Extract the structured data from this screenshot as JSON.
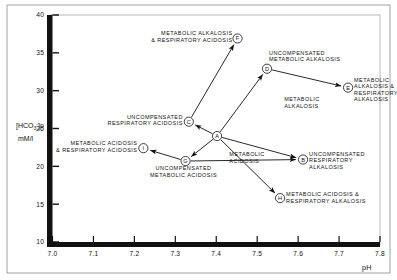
{
  "chart_data": {
    "type": "scatter",
    "title": "",
    "xlabel": "pH",
    "ylabel": "[HCO3-]p mM/l",
    "xlim": [
      7.0,
      7.8
    ],
    "ylim": [
      10,
      40
    ],
    "xticks": [
      "7.0",
      "7.1",
      "7.2",
      "7.3",
      "7.4",
      "7.5",
      "7.6",
      "7.7",
      "7.8"
    ],
    "xtick_values": [
      7.0,
      7.1,
      7.2,
      7.3,
      7.4,
      7.5,
      7.6,
      7.7,
      7.8
    ],
    "yticks": [
      "10",
      "15",
      "20",
      "25",
      "30",
      "35",
      "40"
    ],
    "ytick_values": [
      10,
      15,
      20,
      25,
      30,
      35,
      40
    ],
    "grid": false,
    "legend": "none",
    "points": [
      {
        "id": "A",
        "x": 7.402,
        "y": 24.0,
        "label": "",
        "label_lines": [],
        "label_anchor": "none",
        "label_dx": 0,
        "label_dy": 0
      },
      {
        "id": "B",
        "x": 7.612,
        "y": 20.9,
        "label": "UNCOMPENSATED RESPIRATORY ALKALOSIS",
        "label_lines": [
          "UNCOMPENSATED",
          "RESPIRATORY",
          "ALKALOSIS"
        ],
        "label_anchor": "start",
        "label_dx": 6,
        "label_dy": -4
      },
      {
        "id": "C",
        "x": 7.333,
        "y": 25.9,
        "label": "UNCOMPENSATED RESPIRATORY ACIDOSIS",
        "label_lines": [
          "UNCOMPENSATED",
          "RESPIRATORY  ACIDOSIS"
        ],
        "label_anchor": "end",
        "label_dx": -6,
        "label_dy": -3
      },
      {
        "id": "D",
        "x": 7.524,
        "y": 32.9,
        "label": "UNCOMPENSATED METABOLIC ALKALOSIS",
        "label_lines": [
          "UNCOMPENSATED",
          "METABOLIC  ALKALOSIS"
        ],
        "label_anchor": "start",
        "label_dx": 2,
        "label_dy": -14
      },
      {
        "id": "E",
        "x": 7.722,
        "y": 30.4,
        "label": "METABOLIC ALKALOSIS & RESPIRATORY ALKALOSIS",
        "label_lines": [
          "METABOLIC",
          "ALKALOSIS &",
          "RESPIRATORY",
          "ALKALOSIS"
        ],
        "label_anchor": "start",
        "label_dx": 6,
        "label_dy": -6
      },
      {
        "id": "F",
        "x": 7.452,
        "y": 36.9,
        "label": "METABOLIC ALKALOSIS & RESPIRATORY ACIDOSIS",
        "label_lines": [
          "METABOLIC  ALKALOSIS",
          "& RESPIRATORY  ACIDOSIS"
        ],
        "label_anchor": "end",
        "label_dx": -5,
        "label_dy": -3
      },
      {
        "id": "G",
        "x": 7.325,
        "y": 20.7,
        "label": "UNCOMPENSATED METABOLIC ACIDOSIS",
        "label_lines": [
          "UNCOMPENSATED",
          "METABOLIC  ACIDOSIS"
        ],
        "label_anchor": "middle",
        "label_dx": -2,
        "label_dy": 9
      },
      {
        "id": "H",
        "x": 7.556,
        "y": 15.8,
        "label": "METABOLIC ACIDOSIS & RESPIRATORY ALKALOSIS",
        "label_lines": [
          "METABOLIC  ACIDOSIS  &",
          "RESPIRATORY  ALKALOSIS"
        ],
        "label_anchor": "start",
        "label_dx": 6,
        "label_dy": -2
      },
      {
        "id": "I",
        "x": 7.222,
        "y": 22.4,
        "label": "METABOLIC ACIDOSIS & RESPIRATORY ACIDOSIS",
        "label_lines": [
          "METABOLIC  ACIDOSIS",
          "& RESPIRATORY  ACIDOSIS"
        ],
        "label_anchor": "end",
        "label_dx": -6,
        "label_dy": -3
      }
    ],
    "arrows": [
      {
        "from": "A",
        "to": "B"
      },
      {
        "from": "A",
        "to": "C"
      },
      {
        "from": "A",
        "to": "D"
      },
      {
        "from": "A",
        "to": "G"
      },
      {
        "from": "A",
        "to": "H"
      },
      {
        "from": "C",
        "to": "F"
      },
      {
        "from": "D",
        "to": "E"
      },
      {
        "from": "G",
        "to": "I"
      },
      {
        "from": "G",
        "to": "B"
      }
    ],
    "region_labels": [
      {
        "text_lines": [
          "METABOLIC",
          "ALKALOSIS"
        ],
        "x": 7.566,
        "y": 28.6,
        "anchor": "start"
      },
      {
        "text_lines": [
          "METABOLIC",
          "ACIDOSIS"
        ],
        "x": 7.432,
        "y": 21.4,
        "anchor": "start"
      }
    ]
  },
  "axis": {
    "y_label_line1": "[HCO",
    "y_label_sub": "3",
    "y_label_sup": "-",
    "y_label_line1_end": "]p",
    "y_label_line2": "mM/l",
    "x_label": "pH"
  },
  "colors": {
    "axis": "#111111",
    "frame": "#4a4a4a",
    "text": "#111111",
    "background": "#ffffff"
  }
}
